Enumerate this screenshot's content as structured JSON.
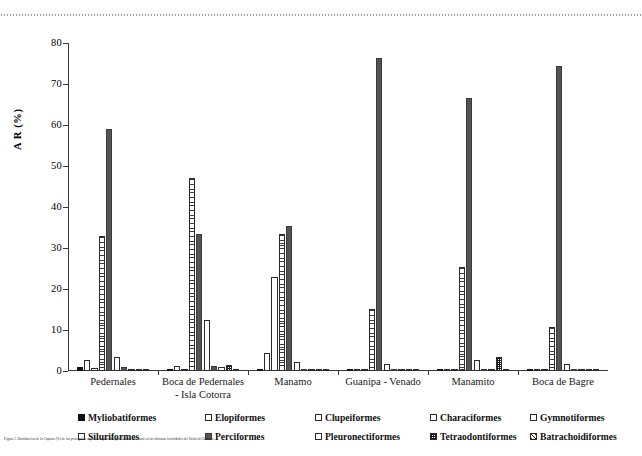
{
  "figure": {
    "caption": "Figura 2. Distribucion de la Captura (%) de las principales especies capturadas por la flota artesanal en las distintas localidades del Delta del Orinoco."
  },
  "chart_data": {
    "type": "bar",
    "title": "",
    "xlabel": "",
    "ylabel": "A R (%)",
    "ylim": [
      0,
      80
    ],
    "yticks": [
      0,
      10,
      20,
      30,
      40,
      50,
      60,
      70,
      80
    ],
    "grid": false,
    "legend_position": "bottom",
    "categories": [
      "Pedernales",
      "Boca de Pedernales - Isla Cotorra",
      "Manamo",
      "Guanipa - Venado",
      "Manamito",
      "Boca de Bagre"
    ],
    "series": [
      {
        "name": "Myliobatiformes",
        "pattern": "solid-black",
        "values": [
          1.0,
          0.4,
          0.5,
          0.3,
          0.4,
          0.5
        ]
      },
      {
        "name": "Elopiformes",
        "pattern": "hollow",
        "values": [
          2.6,
          1.3,
          4.5,
          0.4,
          0.4,
          0.6
        ]
      },
      {
        "name": "Clupeiformes",
        "pattern": "hollow",
        "values": [
          0.8,
          0.3,
          23.0,
          0.5,
          0.5,
          0.5
        ]
      },
      {
        "name": "Characiformes",
        "pattern": "hline",
        "values": [
          33.0,
          47.0,
          33.4,
          15.2,
          25.3,
          10.7
        ]
      },
      {
        "name": "Gymnotiformes",
        "pattern": "dark",
        "values": [
          59.0,
          33.4,
          35.4,
          76.3,
          66.5,
          74.5
        ]
      },
      {
        "name": "Siluriformes",
        "pattern": "hollow",
        "values": [
          3.3,
          12.5,
          2.3,
          1.8,
          2.6,
          1.6
        ]
      },
      {
        "name": "Perciformes",
        "pattern": "dark",
        "values": [
          0.9,
          1.2,
          0.5,
          0.5,
          0.6,
          0.4
        ]
      },
      {
        "name": "Pleuronectiformes",
        "pattern": "hollow",
        "values": [
          0.5,
          0.9,
          0.3,
          0.2,
          0.3,
          0.2
        ]
      },
      {
        "name": "Tetraodontiformes",
        "pattern": "check",
        "values": [
          0.4,
          1.5,
          0.3,
          0.2,
          3.5,
          0.3
        ]
      },
      {
        "name": "Batrachoidiformes",
        "pattern": "diag",
        "values": [
          0.3,
          0.5,
          0.2,
          0.2,
          0.3,
          0.2
        ]
      }
    ],
    "highlights": [
      {
        "group": 0,
        "series": "Myliobatiformes_extra_black",
        "value": 1.9
      }
    ]
  },
  "legend": {
    "row1": [
      {
        "label": "Myliobatiformes",
        "pattern": "solid-black"
      },
      {
        "label": "Elopiformes",
        "pattern": "hollow"
      },
      {
        "label": "Clupeiformes",
        "pattern": "hollow"
      },
      {
        "label": "Characiformes",
        "pattern": "hollow"
      },
      {
        "label": "Gymnotiformes",
        "pattern": "hollow"
      }
    ],
    "row2": [
      {
        "label": "Siluriformes",
        "pattern": "hollow"
      },
      {
        "label": "Perciformes",
        "pattern": "dark"
      },
      {
        "label": "Pleuronectiformes",
        "pattern": "hollow"
      },
      {
        "label": "Tetraodontiformes",
        "pattern": "check"
      },
      {
        "label": "Batrachoidiformes",
        "pattern": "diag"
      }
    ]
  },
  "colors": {
    "axis": "#3a3a3a",
    "bar_dark": "#545454",
    "bar_black": "#111111",
    "bar_outline": "#2b2b2b",
    "background": "#ffffff"
  }
}
